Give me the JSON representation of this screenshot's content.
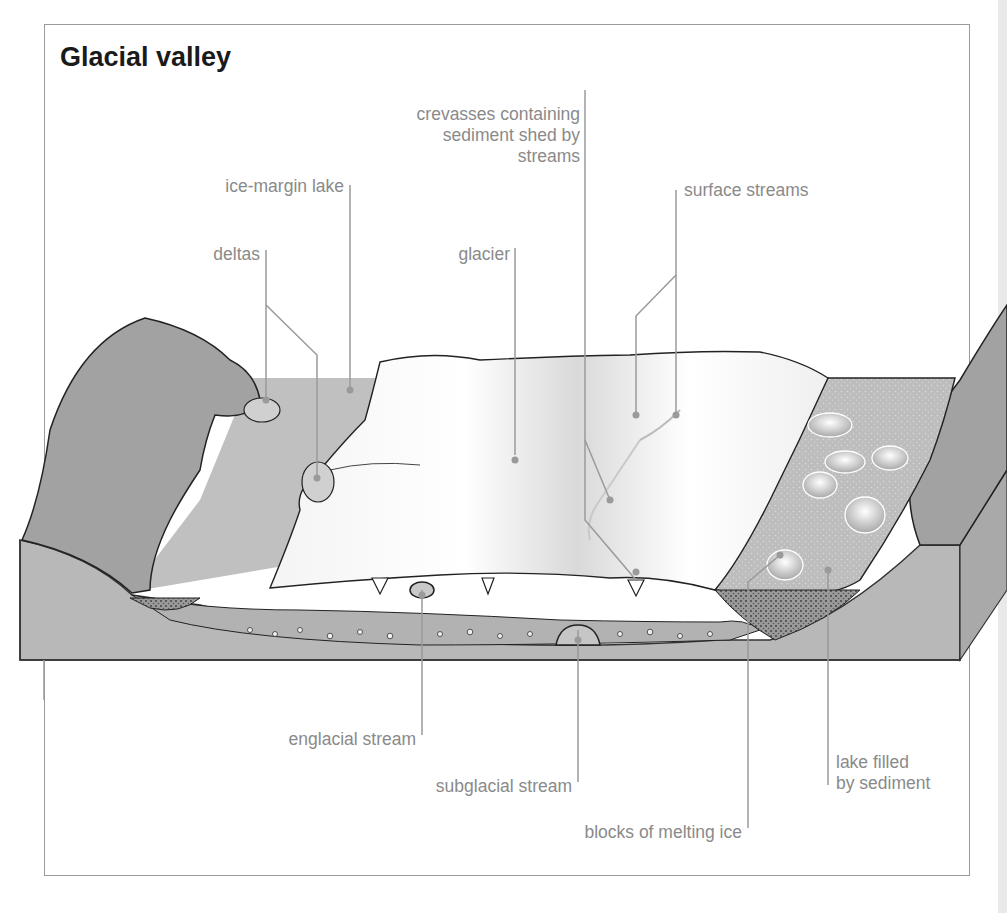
{
  "title": "Glacial valley",
  "labels": {
    "crevasses": [
      "crevasses containing",
      "sediment shed by",
      "streams"
    ],
    "ice_margin_lake": "ice-margin lake",
    "surface_streams": "surface streams",
    "deltas": "deltas",
    "glacier": "glacier",
    "englacial_stream": "englacial stream",
    "subglacial_stream": "subglacial stream",
    "blocks_of_melting_ice": "blocks of melting ice",
    "lake_filled": [
      "lake filled",
      "by sediment"
    ]
  },
  "colors": {
    "rock": "#a2a2a2",
    "ground": "#b9b9b9",
    "lake": "#c2c2c2",
    "glacier": "#f8f8f8",
    "leader": "#9a9a9a",
    "label_text": "#8a8a8a",
    "title_text": "#1a1a1a"
  }
}
